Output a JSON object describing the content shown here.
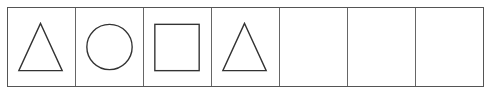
{
  "sequence": {
    "cell_count": 7,
    "cells": [
      {
        "index": 1,
        "shape": "triangle"
      },
      {
        "index": 2,
        "shape": "circle"
      },
      {
        "index": 3,
        "shape": "square"
      },
      {
        "index": 4,
        "shape": "triangle"
      },
      {
        "index": 5,
        "shape": "empty"
      },
      {
        "index": 6,
        "shape": "empty"
      },
      {
        "index": 7,
        "shape": "empty"
      }
    ],
    "stroke_color": "#333333",
    "border_color": "#555555"
  }
}
